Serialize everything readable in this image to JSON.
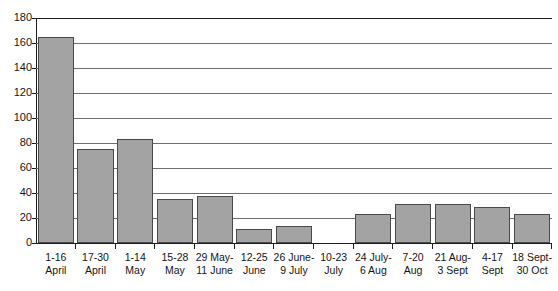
{
  "chart_data": {
    "type": "bar",
    "title": "",
    "xlabel": "",
    "ylabel": "",
    "ylim": [
      0,
      180
    ],
    "y_ticks": [
      0,
      20,
      40,
      60,
      80,
      100,
      120,
      140,
      160,
      180
    ],
    "grid": true,
    "legend": false,
    "bar_color": "#a3a3a3",
    "bar_border_color": "#4a4a4a",
    "axis_color": "#1d1d1d",
    "gridline_color": "#6e6e6e",
    "categories": [
      "1-16 April",
      "17-30 April",
      "1-14 May",
      "15-28 May",
      "29 May-11 June",
      "12-25 June",
      "26 June-9 July",
      "10-23 July",
      "24 July-6 Aug",
      "7-20 Aug",
      "21 Aug-3 Sept",
      "4-17 Sept",
      "18 Sept-30 Oct"
    ],
    "category_lines": [
      {
        "line1": "1-16",
        "line2": "April"
      },
      {
        "line1": "17-30",
        "line2": "April"
      },
      {
        "line1": "1-14",
        "line2": "May"
      },
      {
        "line1": "15-28",
        "line2": "May"
      },
      {
        "line1": "29 May-",
        "line2": "11 June"
      },
      {
        "line1": "12-25",
        "line2": "June"
      },
      {
        "line1": "26 June-",
        "line2": "9 July"
      },
      {
        "line1": "10-23",
        "line2": "July"
      },
      {
        "line1": "24 July-",
        "line2": "6 Aug"
      },
      {
        "line1": "7-20",
        "line2": "Aug"
      },
      {
        "line1": "21 Aug-",
        "line2": "3 Sept"
      },
      {
        "line1": "4-17",
        "line2": "Sept"
      },
      {
        "line1": "18 Sept-",
        "line2": "30 Oct"
      }
    ],
    "values": [
      165,
      75,
      83,
      35,
      38,
      11,
      14,
      0,
      23,
      31,
      31,
      29,
      23
    ]
  }
}
